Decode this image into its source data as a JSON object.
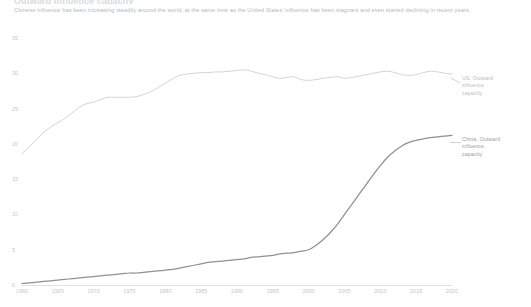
{
  "header": {
    "title": "Outward influence capacity",
    "subtitle": "Chinese influence has been increasing steadily around the world; at the same time as the United States' influence has been stagnant and even started declining in recent years."
  },
  "legend": {
    "us": "US, Outward\ninfluence\ncapacity",
    "china": "China, Outward\ninfluence\ncapacity",
    "us_lines": [
      "US, Outward",
      "influence",
      "capacity"
    ],
    "china_lines": [
      "China, Outward",
      "influence",
      "capacity"
    ]
  },
  "colors": {
    "us_line": "#c9ccd0",
    "china_line": "#8e9195",
    "axis": "#dfe1e4",
    "tick_text": "#c3c6ca",
    "subtitle_text": "#b3b7bc",
    "background": "#ffffff"
  },
  "chart_data": {
    "type": "line",
    "title": "Outward influence capacity",
    "subtitle": "Chinese influence has been increasing steadily around the world; at the same time as the United States' influence has been stagnant and even started declining in recent years.",
    "xlabel": "",
    "ylabel": "",
    "xlim": [
      1960,
      2020
    ],
    "ylim": [
      0,
      35
    ],
    "yticks": [
      0,
      5,
      10,
      15,
      20,
      25,
      30,
      35
    ],
    "ytick_labels": [
      "0",
      "5",
      "10",
      "15",
      "20",
      "25",
      "30",
      "35"
    ],
    "xticks": [
      1960,
      1965,
      1970,
      1975,
      1980,
      1985,
      1990,
      1995,
      2000,
      2005,
      2010,
      2015,
      2020
    ],
    "xtick_labels": [
      "1960",
      "1965",
      "1970",
      "1975",
      "1980",
      "1985",
      "1990",
      "1995",
      "2000",
      "2005",
      "2010",
      "2015",
      "2020"
    ],
    "grid": false,
    "legend_position": "right-inline",
    "x": [
      1960,
      1961,
      1962,
      1963,
      1964,
      1965,
      1966,
      1967,
      1968,
      1969,
      1970,
      1971,
      1972,
      1973,
      1974,
      1975,
      1976,
      1977,
      1978,
      1979,
      1980,
      1981,
      1982,
      1983,
      1984,
      1985,
      1986,
      1987,
      1988,
      1989,
      1990,
      1991,
      1992,
      1993,
      1994,
      1995,
      1996,
      1997,
      1998,
      1999,
      2000,
      2001,
      2002,
      2003,
      2004,
      2005,
      2006,
      2007,
      2008,
      2009,
      2010,
      2011,
      2012,
      2013,
      2014,
      2015,
      2016,
      2017,
      2018,
      2019,
      2020
    ],
    "series": [
      {
        "name": "US, Outward influence capacity",
        "color": "#c9ccd0",
        "values": [
          18.6,
          19.6,
          20.6,
          21.6,
          22.4,
          23.0,
          23.6,
          24.4,
          25.2,
          25.7,
          25.9,
          26.3,
          26.6,
          26.6,
          26.6,
          26.6,
          26.7,
          27.0,
          27.4,
          28.0,
          28.6,
          29.2,
          29.7,
          29.9,
          30.0,
          30.1,
          30.1,
          30.2,
          30.2,
          30.3,
          30.4,
          30.5,
          30.3,
          30.0,
          29.8,
          29.5,
          29.3,
          29.4,
          29.5,
          29.1,
          29.0,
          29.1,
          29.3,
          29.4,
          29.5,
          29.3,
          29.4,
          29.6,
          29.8,
          30.0,
          30.2,
          30.3,
          30.1,
          29.8,
          29.7,
          29.8,
          30.1,
          30.3,
          30.2,
          30.0,
          29.9
        ]
      },
      {
        "name": "China, Outward influence capacity",
        "color": "#8e9195",
        "values": [
          0.2,
          0.3,
          0.4,
          0.5,
          0.6,
          0.7,
          0.8,
          0.9,
          1.0,
          1.1,
          1.2,
          1.3,
          1.4,
          1.5,
          1.6,
          1.7,
          1.7,
          1.8,
          1.9,
          2.0,
          2.1,
          2.2,
          2.4,
          2.6,
          2.8,
          3.0,
          3.2,
          3.3,
          3.4,
          3.5,
          3.6,
          3.7,
          3.9,
          4.0,
          4.1,
          4.2,
          4.4,
          4.5,
          4.6,
          4.8,
          5.0,
          5.6,
          6.4,
          7.4,
          8.6,
          10.0,
          11.4,
          12.8,
          14.2,
          15.6,
          16.9,
          18.1,
          19.0,
          19.7,
          20.2,
          20.5,
          20.7,
          20.9,
          21.0,
          21.1,
          21.2
        ]
      }
    ]
  }
}
